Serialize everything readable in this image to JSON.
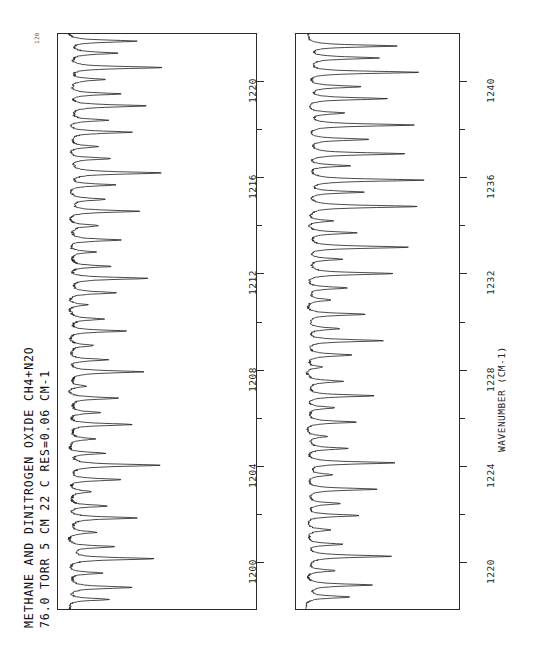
{
  "title": {
    "line1": "METHANE AND DINITROGEN OXIDE   CH4+N2O",
    "line2": "76.0  TORR   5 CM   22 C          RES=0.06 CM-1"
  },
  "axis": {
    "x_title": "WAVENUMBER  (CM-1)",
    "y_corner_label": "120"
  },
  "chart_data": {
    "type": "line",
    "title": "METHANE AND DINITROGEN OXIDE   CH4+N2O",
    "subtitle": "76.0  TORR   5 CM   22 C          RES=0.06 CM-1",
    "xlabel": "WAVENUMBER  (CM-1)",
    "ylabel": "TRANSMITTANCE (%)",
    "orientation": "rotated-90",
    "grid": false,
    "legend": null,
    "ylim": [
      0,
      120
    ],
    "panels": [
      {
        "name": "panel-upper",
        "xlim": [
          1198,
          1222
        ],
        "ticks": [
          1200,
          1204,
          1208,
          1212,
          1216,
          1220
        ],
        "tick_labels": [
          "1200",
          "1204",
          "1208",
          "1212",
          "1216",
          "1220"
        ],
        "baseline_transmittance": 100,
        "peaks": [
          {
            "x": 1198.4,
            "depth": 28
          },
          {
            "x": 1198.9,
            "depth": 40
          },
          {
            "x": 1199.5,
            "depth": 22
          },
          {
            "x": 1200.1,
            "depth": 55
          },
          {
            "x": 1200.6,
            "depth": 30
          },
          {
            "x": 1201.2,
            "depth": 18
          },
          {
            "x": 1201.8,
            "depth": 44
          },
          {
            "x": 1202.3,
            "depth": 26
          },
          {
            "x": 1202.9,
            "depth": 14
          },
          {
            "x": 1203.4,
            "depth": 36
          },
          {
            "x": 1204.0,
            "depth": 58
          },
          {
            "x": 1204.5,
            "depth": 24
          },
          {
            "x": 1205.1,
            "depth": 16
          },
          {
            "x": 1205.7,
            "depth": 42
          },
          {
            "x": 1206.2,
            "depth": 20
          },
          {
            "x": 1206.8,
            "depth": 33
          },
          {
            "x": 1207.3,
            "depth": 12
          },
          {
            "x": 1207.9,
            "depth": 48
          },
          {
            "x": 1208.4,
            "depth": 26
          },
          {
            "x": 1209.0,
            "depth": 15
          },
          {
            "x": 1209.6,
            "depth": 38
          },
          {
            "x": 1210.1,
            "depth": 21
          },
          {
            "x": 1210.7,
            "depth": 13
          },
          {
            "x": 1211.2,
            "depth": 30
          },
          {
            "x": 1211.8,
            "depth": 52
          },
          {
            "x": 1212.3,
            "depth": 27
          },
          {
            "x": 1212.9,
            "depth": 17
          },
          {
            "x": 1213.4,
            "depth": 35
          },
          {
            "x": 1214.0,
            "depth": 19
          },
          {
            "x": 1214.6,
            "depth": 46
          },
          {
            "x": 1215.1,
            "depth": 23
          },
          {
            "x": 1215.7,
            "depth": 31
          },
          {
            "x": 1216.2,
            "depth": 60
          },
          {
            "x": 1216.8,
            "depth": 28
          },
          {
            "x": 1217.3,
            "depth": 18
          },
          {
            "x": 1217.9,
            "depth": 41
          },
          {
            "x": 1218.4,
            "depth": 25
          },
          {
            "x": 1219.0,
            "depth": 50
          },
          {
            "x": 1219.5,
            "depth": 34
          },
          {
            "x": 1220.1,
            "depth": 22
          },
          {
            "x": 1220.6,
            "depth": 62
          },
          {
            "x": 1221.2,
            "depth": 30
          },
          {
            "x": 1221.7,
            "depth": 45
          }
        ]
      },
      {
        "name": "panel-lower",
        "xlim": [
          1218,
          1242
        ],
        "ticks": [
          1220,
          1224,
          1228,
          1232,
          1236,
          1240
        ],
        "tick_labels": [
          "1220",
          "1224",
          "1228",
          "1232",
          "1236",
          "1240"
        ],
        "baseline_transmittance": 100,
        "peaks": [
          {
            "x": 1218.5,
            "depth": 35
          },
          {
            "x": 1219.0,
            "depth": 52
          },
          {
            "x": 1219.6,
            "depth": 24
          },
          {
            "x": 1220.2,
            "depth": 68
          },
          {
            "x": 1220.7,
            "depth": 30
          },
          {
            "x": 1221.3,
            "depth": 18
          },
          {
            "x": 1221.9,
            "depth": 44
          },
          {
            "x": 1222.4,
            "depth": 26
          },
          {
            "x": 1223.0,
            "depth": 58
          },
          {
            "x": 1223.6,
            "depth": 20
          },
          {
            "x": 1224.1,
            "depth": 72
          },
          {
            "x": 1224.7,
            "depth": 32
          },
          {
            "x": 1225.2,
            "depth": 16
          },
          {
            "x": 1225.8,
            "depth": 40
          },
          {
            "x": 1226.4,
            "depth": 22
          },
          {
            "x": 1226.9,
            "depth": 55
          },
          {
            "x": 1227.5,
            "depth": 28
          },
          {
            "x": 1228.1,
            "depth": 14
          },
          {
            "x": 1228.6,
            "depth": 36
          },
          {
            "x": 1229.2,
            "depth": 62
          },
          {
            "x": 1229.7,
            "depth": 25
          },
          {
            "x": 1230.3,
            "depth": 48
          },
          {
            "x": 1230.9,
            "depth": 19
          },
          {
            "x": 1231.4,
            "depth": 33
          },
          {
            "x": 1232.0,
            "depth": 70
          },
          {
            "x": 1232.6,
            "depth": 27
          },
          {
            "x": 1233.1,
            "depth": 82
          },
          {
            "x": 1233.7,
            "depth": 38
          },
          {
            "x": 1234.2,
            "depth": 21
          },
          {
            "x": 1234.8,
            "depth": 88
          },
          {
            "x": 1235.4,
            "depth": 46
          },
          {
            "x": 1235.9,
            "depth": 92
          },
          {
            "x": 1236.5,
            "depth": 34
          },
          {
            "x": 1237.0,
            "depth": 78
          },
          {
            "x": 1237.6,
            "depth": 50
          },
          {
            "x": 1238.2,
            "depth": 86
          },
          {
            "x": 1238.7,
            "depth": 29
          },
          {
            "x": 1239.3,
            "depth": 64
          },
          {
            "x": 1239.8,
            "depth": 42
          },
          {
            "x": 1240.4,
            "depth": 90
          },
          {
            "x": 1241.0,
            "depth": 56
          },
          {
            "x": 1241.5,
            "depth": 74
          }
        ]
      }
    ]
  }
}
